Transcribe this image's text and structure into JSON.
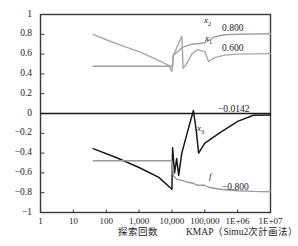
{
  "chart_data": {
    "type": "line",
    "title": "",
    "xlabel": "探索回数",
    "ylabel": "",
    "xscale": "log",
    "xlim": [
      1,
      10000000
    ],
    "ylim": [
      -1,
      1
    ],
    "grid": false,
    "legend": "inline-right",
    "x_ticklabels": [
      "1",
      "10",
      "100",
      "1,000",
      "10,000",
      "100,000",
      "1E+06",
      "1E+07"
    ],
    "x_tickvalues": [
      1,
      10,
      100,
      1000,
      10000,
      100000,
      1000000,
      10000000
    ],
    "y_ticklabels": [
      "1",
      "0.8",
      "0.6",
      "0.4",
      "0.2",
      "0",
      "−0.2",
      "−0.4",
      "−0.6",
      "−0.8",
      "−1"
    ],
    "y_tickvalues": [
      1,
      0.8,
      0.6,
      0.4,
      0.2,
      0,
      -0.2,
      -0.4,
      -0.6,
      -0.8,
      -1
    ],
    "series": [
      {
        "name": "x2",
        "label": "x",
        "sub": "2",
        "color": "#a8a8a8",
        "final_value": "0.800",
        "points": [
          [
            40,
            0.8
          ],
          [
            100,
            0.745
          ],
          [
            300,
            0.685
          ],
          [
            1000,
            0.625
          ],
          [
            3000,
            0.555
          ],
          [
            8000,
            0.485
          ],
          [
            10000,
            0.425
          ],
          [
            11000,
            0.585
          ],
          [
            20000,
            0.78
          ],
          [
            22000,
            0.455
          ],
          [
            30000,
            0.52
          ],
          [
            40000,
            0.6
          ],
          [
            60000,
            0.645
          ],
          [
            100000,
            0.625
          ],
          [
            130000,
            0.525
          ],
          [
            200000,
            0.565
          ],
          [
            400000,
            0.59
          ],
          [
            1000000,
            0.6
          ],
          [
            10000000,
            0.605
          ]
        ]
      },
      {
        "name": "x1",
        "label": "x",
        "sub": "1",
        "color": "#a0a0a0",
        "final_value": "0.600",
        "points": [
          [
            40,
            0.478
          ],
          [
            1000,
            0.478
          ],
          [
            8000,
            0.478
          ],
          [
            10000,
            0.478
          ],
          [
            10500,
            0.48
          ],
          [
            11000,
            0.585
          ],
          [
            20000,
            0.665
          ],
          [
            40000,
            0.7
          ],
          [
            60000,
            0.705
          ],
          [
            100000,
            0.715
          ],
          [
            200000,
            0.775
          ],
          [
            400000,
            0.795
          ],
          [
            1000000,
            0.8
          ],
          [
            10000000,
            0.805
          ]
        ]
      },
      {
        "name": "x3",
        "label": "x",
        "sub": "3",
        "color": "#1a1a1a",
        "final_value": "−0.0142",
        "points": [
          [
            40,
            -0.355
          ],
          [
            200,
            -0.445
          ],
          [
            1000,
            -0.545
          ],
          [
            4000,
            -0.645
          ],
          [
            10000,
            -0.765
          ],
          [
            10500,
            -0.345
          ],
          [
            12000,
            -0.6
          ],
          [
            14000,
            -0.455
          ],
          [
            16000,
            -0.625
          ],
          [
            20000,
            -0.4
          ],
          [
            30000,
            -0.18
          ],
          [
            45000,
            0.03
          ],
          [
            55000,
            -0.17
          ],
          [
            65000,
            -0.4
          ],
          [
            100000,
            -0.3
          ],
          [
            300000,
            -0.19
          ],
          [
            1000000,
            -0.08
          ],
          [
            3000000,
            -0.018
          ],
          [
            10000000,
            -0.0142
          ]
        ]
      },
      {
        "name": "f",
        "label": "f",
        "sub": "",
        "color": "#9a9a9a",
        "final_value": "−0.800",
        "points": [
          [
            40,
            -0.478
          ],
          [
            1000,
            -0.478
          ],
          [
            8000,
            -0.478
          ],
          [
            10000,
            -0.478
          ],
          [
            11000,
            -0.625
          ],
          [
            14000,
            -0.665
          ],
          [
            20000,
            -0.675
          ],
          [
            30000,
            -0.695
          ],
          [
            45000,
            -0.705
          ],
          [
            60000,
            -0.725
          ],
          [
            80000,
            -0.725
          ],
          [
            100000,
            -0.725
          ],
          [
            130000,
            -0.745
          ],
          [
            300000,
            -0.765
          ],
          [
            1000000,
            -0.78
          ],
          [
            3000000,
            -0.787
          ],
          [
            10000000,
            -0.79
          ]
        ]
      }
    ],
    "zero_line": {
      "value": 0,
      "color": "#1a1a1a"
    },
    "annotations": [
      {
        "name": "x2-value",
        "text": "0.800",
        "y": 0.8
      },
      {
        "name": "x1-value",
        "text": "0.600",
        "y": 0.6
      },
      {
        "name": "x3-value",
        "text": "−0.0142",
        "y": -0.0142
      },
      {
        "name": "f-value",
        "text": "−0.800",
        "y": -0.8
      }
    ]
  },
  "footer": {
    "xaxis_title": "探索回数",
    "method_caption": "KMAP（Simu2次計画法）1"
  }
}
